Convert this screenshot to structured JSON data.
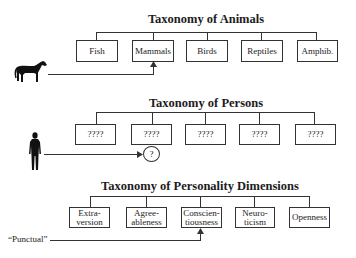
{
  "sections": [
    {
      "title": "Taxonomy of Animals",
      "categories": [
        "Fish",
        "Mammals",
        "Birds",
        "Reptiles",
        "Amphib."
      ],
      "example_icon": "horse-icon",
      "example_target": "Mammals"
    },
    {
      "title": "Taxonomy of Persons",
      "categories": [
        "????",
        "????",
        "????",
        "????",
        "????"
      ],
      "example_icon": "person-silhouette-icon",
      "unknown_marker": "?"
    },
    {
      "title": "Taxonomy of Personality Dimensions",
      "categories": [
        "Extra-\nversion",
        "Agree-\nableness",
        "Conscien-\ntiousness",
        "Neuro-\nticism",
        "Openness"
      ],
      "example_label": "“Punctual”",
      "example_target": "Conscientiousness"
    }
  ]
}
